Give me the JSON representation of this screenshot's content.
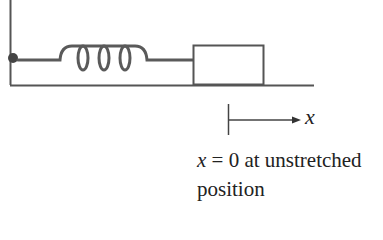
{
  "diagram": {
    "type": "mass-spring system",
    "axis_label": "x",
    "caption": {
      "variable": "x",
      "equation_rest": " = 0 at unstretched",
      "line2": "position"
    },
    "colors": {
      "line": "#555555",
      "spring": "#5a5a5a",
      "pivot": "#444444",
      "text": "#222222"
    }
  }
}
